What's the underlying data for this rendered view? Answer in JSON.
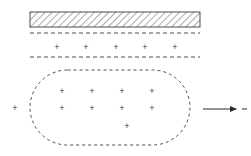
{
  "figure": {
    "type": "physics-schematic-diagram",
    "canvas": {
      "width": 251,
      "height": 156,
      "background": "#ffffff"
    },
    "stroke_color": "#3b3b3b",
    "charge_symbol": "+",
    "arrow_symbol": "→"
  },
  "hatched_slab": {
    "name": "hatched-slab",
    "x": 30,
    "y": 12,
    "width": 170,
    "height": 15,
    "hatch_angle_deg": 45,
    "hatch_spacing": 5,
    "border_color": "#3b3b3b",
    "hatch_color": "#555555"
  },
  "dashed_lines": [
    {
      "label": "upper-dashed-line",
      "x1": 30,
      "y1": 33,
      "x2": 200,
      "y2": 33
    },
    {
      "label": "lower-dashed-line",
      "x1": 30,
      "y1": 57,
      "x2": 200,
      "y2": 57
    }
  ],
  "slab_charge_row": {
    "label": "charge-row-between-dashed-lines",
    "count": 5,
    "y": 47,
    "x_positions": [
      57,
      86,
      116,
      145,
      175
    ],
    "symbol": "+"
  },
  "stadium": {
    "name": "dashed-stadium-region",
    "x": 30,
    "y": 70,
    "width": 160,
    "height": 75,
    "corner_radius": 37.5,
    "stroke": "#3b3b3b",
    "dash_pattern": "3 3",
    "fill": "none"
  },
  "stadium_charges": {
    "label": "charges-inside-stadium",
    "total_count": 9,
    "rows": [
      {
        "y": 91,
        "x_positions": [
          62,
          92,
          122,
          152
        ]
      },
      {
        "y": 108,
        "x_positions": [
          62,
          92,
          122,
          152
        ]
      },
      {
        "y": 126,
        "x_positions": [
          127
        ]
      }
    ],
    "symbol": "+"
  },
  "external_charge": {
    "label": "charge-outside-stadium-left",
    "x": 15,
    "y": 108,
    "symbol": "+"
  },
  "arrow": {
    "name": "direction-arrow-right",
    "x1": 203,
    "y1": 109,
    "x2": 238,
    "y2": 109,
    "head_length": 6,
    "head_width": 4,
    "color": "#2b2b2b",
    "tick_mark": {
      "x1": 242,
      "y1": 109,
      "x2": 247,
      "y2": 109
    }
  },
  "captions": {
    "title": "",
    "notes": ""
  }
}
